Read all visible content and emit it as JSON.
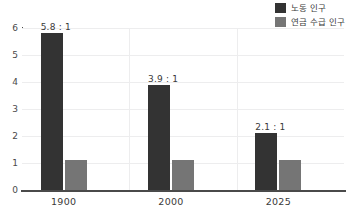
{
  "chart_data": {
    "type": "bar",
    "title": "",
    "subtitle": "",
    "xlabel": "",
    "ylabel": "",
    "categories": [
      "1900",
      "2000",
      "2025"
    ],
    "series": [
      {
        "name": "노동 인구",
        "color": "#333333",
        "values": [
          5.8,
          3.9,
          2.1
        ]
      },
      {
        "name": "연금 수급 인구",
        "color": "#757575",
        "values": [
          1.1,
          1.1,
          1.1
        ]
      }
    ],
    "data_labels": [
      "5.8 : 1",
      "3.9 : 1",
      "2.1 : 1"
    ],
    "ylim": [
      0,
      6
    ],
    "yticks": [
      "0",
      "1",
      "2",
      "3",
      "4",
      "5",
      "6"
    ],
    "ytick_values": [
      0,
      1,
      2,
      3,
      4,
      5,
      6
    ],
    "grid": true,
    "grid_color": "#ededee",
    "legend_position": "top-right",
    "axis_color": "#4a4a4a",
    "background": "#ffffff"
  },
  "legend": {
    "items": [
      {
        "label": "노동 인구",
        "color": "#333333"
      },
      {
        "label": "연금 수급 인구",
        "color": "#757575"
      }
    ]
  }
}
